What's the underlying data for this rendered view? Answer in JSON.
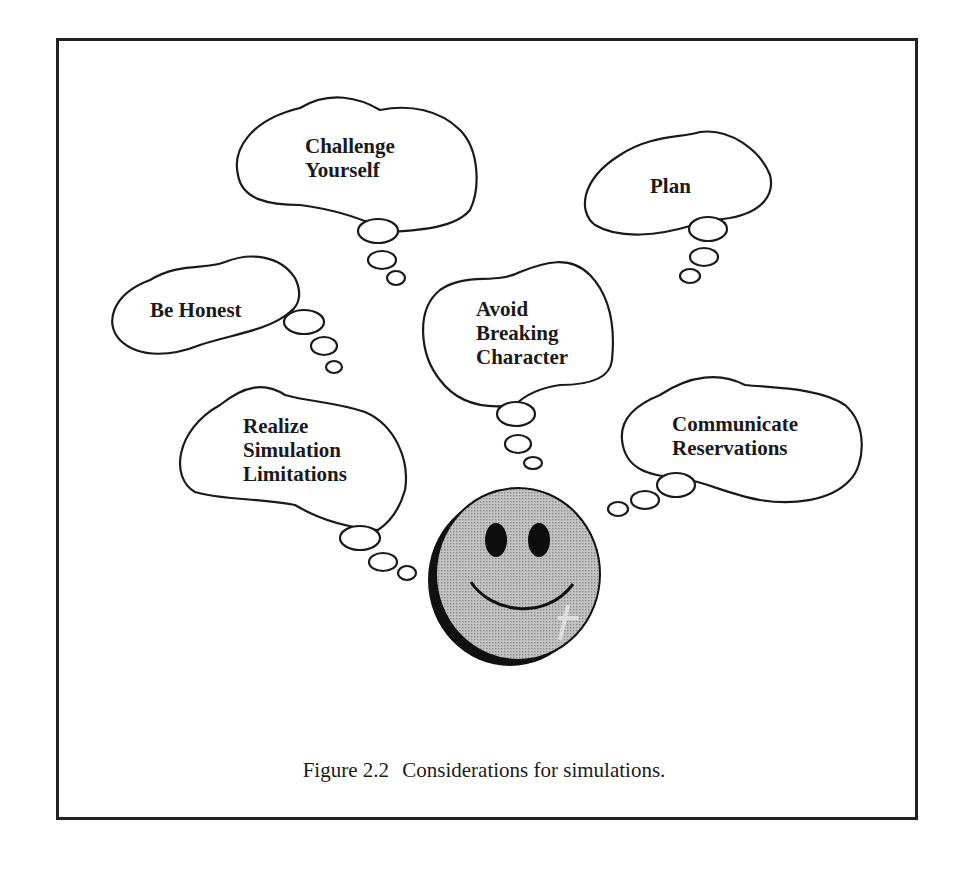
{
  "figure": {
    "number": "Figure 2.2",
    "caption": "Considerations for simulations.",
    "colors": {
      "outline": "#1a1a1a",
      "face_fill": "#b5b5b5",
      "face_shadow": "#111111",
      "background": "#ffffff"
    }
  },
  "bubbles": [
    {
      "id": "challenge-yourself",
      "lines": [
        "Challenge",
        "Yourself"
      ]
    },
    {
      "id": "plan",
      "lines": [
        "Plan"
      ]
    },
    {
      "id": "be-honest",
      "lines": [
        "Be Honest"
      ]
    },
    {
      "id": "avoid-breaking-character",
      "lines": [
        "Avoid",
        "Breaking",
        "Character"
      ]
    },
    {
      "id": "realize-simulation-limitations",
      "lines": [
        "Realize",
        "Simulation",
        "Limitations"
      ]
    },
    {
      "id": "communicate-reservations",
      "lines": [
        "Communicate",
        "Reservations"
      ]
    }
  ],
  "center_figure": {
    "icon": "smiley-face-icon"
  }
}
